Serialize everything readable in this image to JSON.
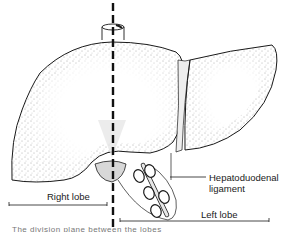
{
  "figure": {
    "labels": {
      "right_lobe": "Right lobe",
      "left_lobe": "Left lobe",
      "hepatoduodenal_line1": "Hepatoduodenal",
      "hepatoduodenal_line2": "ligament"
    },
    "caption": "The division plane between the lobes",
    "colors": {
      "outline": "#1a1a1a",
      "stipple": "#555555",
      "background": "#ffffff",
      "gallbladder_tint": "#cfcfcf"
    }
  }
}
